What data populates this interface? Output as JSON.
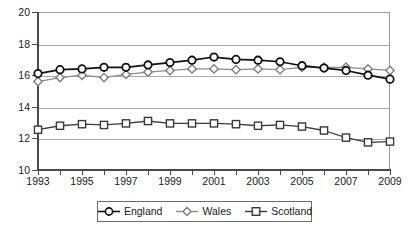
{
  "chart_data": {
    "type": "line",
    "title": "",
    "xlabel": "",
    "ylabel": "",
    "xlim": [
      1993,
      2009
    ],
    "ylim": [
      10,
      20
    ],
    "grid": true,
    "legend_position": "bottom",
    "x": [
      1993,
      1994,
      1995,
      1996,
      1997,
      1998,
      1999,
      2000,
      2001,
      2002,
      2003,
      2004,
      2005,
      2006,
      2007,
      2008,
      2009
    ],
    "x_tick_labels": [
      "1993",
      "",
      "1995",
      "",
      "1997",
      "",
      "1999",
      "",
      "2001",
      "",
      "2003",
      "",
      "2005",
      "",
      "2007",
      "",
      "2009"
    ],
    "y_tick_labels": [
      "10",
      "12",
      "14",
      "16",
      "18",
      "20"
    ],
    "y_ticks": [
      10,
      12,
      14,
      16,
      18,
      20
    ],
    "series": [
      {
        "name": "England",
        "marker": "circle",
        "color": "#111111",
        "values": [
          16.1,
          16.35,
          16.4,
          16.5,
          16.5,
          16.65,
          16.8,
          16.95,
          17.15,
          17.0,
          16.95,
          16.85,
          16.6,
          16.45,
          16.3,
          16.0,
          15.75
        ]
      },
      {
        "name": "Wales",
        "marker": "diamond",
        "color": "#8c8c8c",
        "values": [
          15.6,
          15.85,
          16.0,
          15.85,
          16.05,
          16.2,
          16.3,
          16.4,
          16.4,
          16.35,
          16.4,
          16.35,
          16.5,
          16.5,
          16.5,
          16.4,
          16.3
        ]
      },
      {
        "name": "Scotland",
        "marker": "square",
        "color": "#3a3a3a",
        "values": [
          12.55,
          12.8,
          12.9,
          12.85,
          12.95,
          13.1,
          12.95,
          12.95,
          12.95,
          12.9,
          12.8,
          12.85,
          12.75,
          12.5,
          12.05,
          11.75,
          11.8
        ]
      }
    ]
  },
  "legend": {
    "items": [
      {
        "label": "England",
        "marker": "circle-marker"
      },
      {
        "label": "Wales",
        "marker": "diamond-marker"
      },
      {
        "label": "Scotland",
        "marker": "square-marker"
      }
    ]
  }
}
